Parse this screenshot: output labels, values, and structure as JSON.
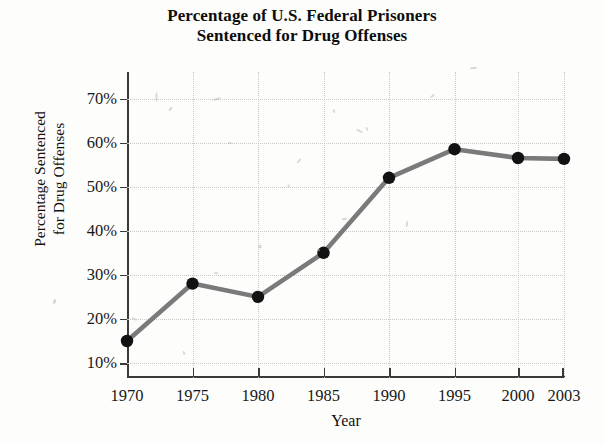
{
  "chart_data": {
    "type": "line",
    "title": "Percentage of U.S. Federal Prisoners Sentenced for Drug Offenses",
    "title_lines": [
      "Percentage of U.S. Federal Prisoners",
      "Sentenced for Drug Offenses"
    ],
    "xlabel": "Year",
    "ylabel": "Percentage Sentenced for Drug Offenses",
    "ylabel_lines": [
      "Percentage Sentenced",
      "for Drug Offenses"
    ],
    "x": [
      1970,
      1975,
      1980,
      1985,
      1990,
      1995,
      2000,
      2003
    ],
    "categories": [
      "1970",
      "1975",
      "1980",
      "1985",
      "1990",
      "1995",
      "2000",
      "2003"
    ],
    "values": [
      15,
      28,
      25,
      35,
      52,
      58.5,
      56.5,
      56.3
    ],
    "xtick_labels": [
      "1970",
      "1975",
      "1980",
      "1985",
      "1990",
      "1995",
      "2000",
      "2003"
    ],
    "ytick_labels": [
      "10%",
      "20%",
      "30%",
      "40%",
      "50%",
      "60%",
      "70%"
    ],
    "ytick_values": [
      10,
      20,
      30,
      40,
      50,
      60,
      70
    ],
    "ylim": [
      6.6,
      76
    ],
    "xlim": [
      1970,
      2003
    ],
    "grid": true,
    "legend": false,
    "legend_position": "none",
    "line_color": "#7a7a7a",
    "marker_color": "#121212",
    "grid_color": "#c9c9c9",
    "axis_color": "#3a3a3a",
    "text_color": "#171717"
  }
}
